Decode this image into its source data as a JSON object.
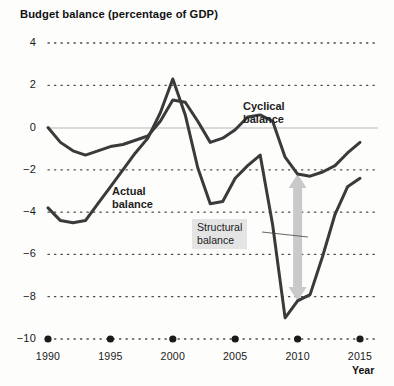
{
  "chart_data": {
    "type": "line",
    "title": "Budget balance (percentage of GDP)",
    "xlabel": "Year",
    "ylabel": "",
    "xlim": [
      1990,
      2016
    ],
    "ylim": [
      -10,
      4
    ],
    "grid": "dotted-horizontal",
    "zero_line": true,
    "legend": "inline-annotations",
    "x_ticks": [
      "1990",
      "1995",
      "2000",
      "2005",
      "2010",
      "2015"
    ],
    "x_tick_values": [
      1990,
      1995,
      2000,
      2005,
      2010,
      2015
    ],
    "y_ticks": [
      "4",
      "2",
      "0",
      "−2",
      "−4",
      "−6",
      "−8",
      "−10"
    ],
    "y_tick_values": [
      4,
      2,
      0,
      -2,
      -4,
      -6,
      -8,
      -10
    ],
    "series": [
      {
        "name": "Cyclical balance",
        "color": "#3a3a3a",
        "x": [
          1990,
          1991,
          1992,
          1993,
          1994,
          1995,
          1996,
          1997,
          1998,
          1999,
          2000,
          2001,
          2002,
          2003,
          2004,
          2005,
          2006,
          2007,
          2008,
          2009,
          2010,
          2011,
          2012,
          2013,
          2014,
          2015
        ],
        "values": [
          0.0,
          -0.7,
          -1.1,
          -1.3,
          -1.1,
          -0.9,
          -0.8,
          -0.6,
          -0.4,
          0.3,
          1.3,
          1.2,
          0.3,
          -0.7,
          -0.5,
          -0.1,
          0.5,
          0.6,
          0.3,
          -1.4,
          -2.2,
          -2.3,
          -2.1,
          -1.8,
          -1.2,
          -0.7
        ]
      },
      {
        "name": "Actual balance",
        "color": "#3a3a3a",
        "x": [
          1990,
          1991,
          1992,
          1993,
          1994,
          1995,
          1996,
          1997,
          1998,
          1999,
          2000,
          2001,
          2002,
          2003,
          2004,
          2005,
          2006,
          2007,
          2008,
          2009,
          2010,
          2011,
          2012,
          2013,
          2014,
          2015
        ],
        "values": [
          -3.8,
          -4.4,
          -4.5,
          -4.4,
          -3.6,
          -2.8,
          -2.0,
          -1.2,
          -0.5,
          0.7,
          2.3,
          0.6,
          -1.9,
          -3.6,
          -3.5,
          -2.4,
          -1.8,
          -1.3,
          -4.6,
          -9.0,
          -8.2,
          -7.9,
          -6.1,
          -4.1,
          -2.8,
          -2.4
        ]
      }
    ],
    "annotations": [
      {
        "name": "cyclical-balance-label",
        "text_line1": "Cyclical",
        "text_line2": "balance"
      },
      {
        "name": "actual-balance-label",
        "text_line1": "Actual",
        "text_line2": "balance"
      },
      {
        "name": "structural-balance-callout",
        "text_line1": "Structural",
        "text_line2": "balance"
      }
    ],
    "structural_arrow": {
      "name": "structural-balance-arrow",
      "color": "#c9c9c9",
      "year": 2010,
      "from_value": -8.2,
      "to_value": -2.2,
      "double_headed": true
    }
  },
  "axis": {
    "y_labels": [
      "4",
      "2",
      "0",
      "−2",
      "−4",
      "−6",
      "−8",
      "−10"
    ],
    "x_labels": [
      "1990",
      "1995",
      "2000",
      "2005",
      "2010",
      "2015"
    ],
    "x_axis_title": "Year"
  },
  "labels": {
    "cyclical_line1": "Cyclical",
    "cyclical_line2": "balance",
    "actual_line1": "Actual",
    "actual_line2": "balance",
    "structural_line1": "Structural",
    "structural_line2": "balance"
  },
  "colors": {
    "line": "#3a3a3a",
    "arrow": "#c9c9c9",
    "grid": "#4a4a4a",
    "zero_line": "#b8b8b8",
    "callout_bg": "#e4e4e4",
    "background": "#fdfdfc"
  }
}
